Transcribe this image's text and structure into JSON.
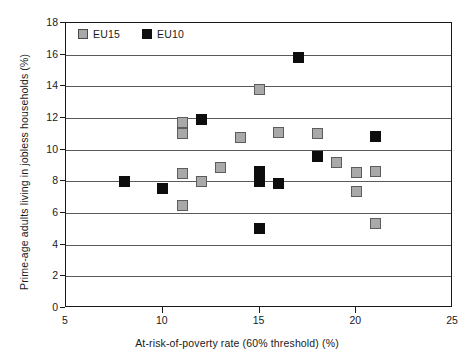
{
  "chart_data": {
    "type": "scatter",
    "title": "",
    "xlabel": "At-risk-of-poverty rate (60% threshold) (%)",
    "ylabel": "Prime-age adults living in jobless households (%)",
    "xlim": [
      5,
      25
    ],
    "ylim": [
      0,
      18
    ],
    "xticks": [
      5,
      10,
      15,
      20,
      25
    ],
    "yticks": [
      0,
      2,
      4,
      6,
      8,
      10,
      12,
      14,
      16,
      18
    ],
    "xtick_labels": [
      "5",
      "10",
      "15",
      "20",
      "25"
    ],
    "ytick_labels": [
      "0",
      "2",
      "4",
      "6",
      "8",
      "10",
      "12",
      "14",
      "16",
      "18"
    ],
    "grid": "horizontal",
    "legend_position": "top-left",
    "series": [
      {
        "name": "EU15",
        "color": "#a9a9a9",
        "edge_color": "#5c5c5c",
        "marker": "square",
        "points": [
          {
            "x": 11.0,
            "y": 11.7
          },
          {
            "x": 11.0,
            "y": 11.0
          },
          {
            "x": 11.0,
            "y": 8.5
          },
          {
            "x": 11.0,
            "y": 6.5
          },
          {
            "x": 12.0,
            "y": 8.0
          },
          {
            "x": 13.0,
            "y": 8.85
          },
          {
            "x": 14.0,
            "y": 10.8
          },
          {
            "x": 15.0,
            "y": 13.8
          },
          {
            "x": 16.0,
            "y": 11.1
          },
          {
            "x": 18.0,
            "y": 11.0
          },
          {
            "x": 19.0,
            "y": 9.2
          },
          {
            "x": 20.0,
            "y": 8.55
          },
          {
            "x": 20.0,
            "y": 7.35
          },
          {
            "x": 21.0,
            "y": 8.65
          },
          {
            "x": 21.0,
            "y": 5.35
          }
        ]
      },
      {
        "name": "EU10",
        "color": "#0d0d0d",
        "edge_color": "#0d0d0d",
        "marker": "square",
        "points": [
          {
            "x": 8.0,
            "y": 8.0
          },
          {
            "x": 10.0,
            "y": 7.55
          },
          {
            "x": 12.0,
            "y": 11.9
          },
          {
            "x": 15.0,
            "y": 8.6
          },
          {
            "x": 15.0,
            "y": 8.0
          },
          {
            "x": 15.0,
            "y": 5.0
          },
          {
            "x": 16.0,
            "y": 7.85
          },
          {
            "x": 17.0,
            "y": 15.85
          },
          {
            "x": 18.0,
            "y": 9.55
          },
          {
            "x": 21.0,
            "y": 10.85
          }
        ]
      }
    ]
  },
  "legend": {
    "entries": [
      {
        "label": "EU15",
        "key": "eu15"
      },
      {
        "label": "EU10",
        "key": "eu10"
      }
    ]
  }
}
